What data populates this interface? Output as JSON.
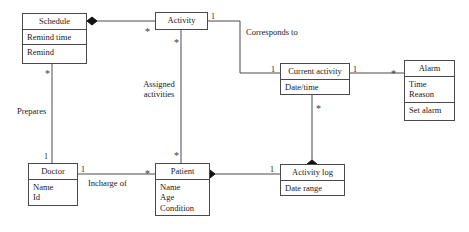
{
  "diagram": {
    "background_color": "#ffffff",
    "line_color": "#4a4a4a",
    "text_color": "#1a1a1a"
  },
  "classes": {
    "schedule": {
      "name": "Schedule",
      "attributes": [
        "Remind time",
        "Remind"
      ]
    },
    "activity": {
      "name": "Activity",
      "attributes": []
    },
    "current_activity": {
      "name": "Current activity",
      "attributes": [
        "Date/time"
      ]
    },
    "alarm": {
      "name": "Alarm",
      "attributes": [
        "Time",
        "Reason"
      ],
      "operations": [
        "Set alarm"
      ]
    },
    "doctor": {
      "name": "Doctor",
      "attributes": [
        "Name",
        "Id"
      ]
    },
    "patient": {
      "name": "Patient",
      "attributes": [
        "Name",
        "Age",
        "Condition"
      ]
    },
    "activity_log": {
      "name": "Activity log",
      "attributes": [
        "Date range"
      ]
    }
  },
  "relationship_labels": {
    "corresponds_to": "Corresponds to",
    "assigned_activities_line1": "Assigned",
    "assigned_activities_line2": "activities",
    "prepares": "Prepares",
    "incharge_of": "Incharge of"
  },
  "multiplicities": {
    "activity_right_1": "1",
    "current_activity_left_1": "1",
    "current_activity_right_1": "1",
    "alarm_left_star": "*",
    "activity_left_star": "*",
    "activity_bottom_star": "*",
    "schedule_bottom_star": "*",
    "doctor_top_1": "1",
    "doctor_right_1": "1",
    "patient_left_star": "*",
    "patient_top_star": "*",
    "current_activity_bottom_star": "*",
    "activity_log_left_1": "1"
  }
}
